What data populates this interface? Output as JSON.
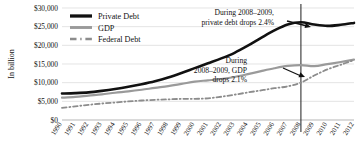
{
  "chart_data": {
    "type": "line",
    "title": "",
    "xlabel": "",
    "ylabel": "In billion",
    "ylim": [
      0,
      30000
    ],
    "y_ticks": [
      "$0",
      "$5,000",
      "$10,000",
      "$15,000",
      "$20,000",
      "$25,000",
      "$30,000"
    ],
    "y_tick_values": [
      0,
      5000,
      10000,
      15000,
      20000,
      25000,
      30000
    ],
    "grid": true,
    "legend_position": "top-left",
    "categories": [
      "1990",
      "1991",
      "1992",
      "1993",
      "1994",
      "1995",
      "1996",
      "1997",
      "1998",
      "1999",
      "2000",
      "2001",
      "2002",
      "2003",
      "2004",
      "2005",
      "2006",
      "2007",
      "2008",
      "2009",
      "2010",
      "2011",
      "2012"
    ],
    "series": [
      {
        "name": "Private Debt",
        "color": "#111111",
        "style": "solid",
        "width": 2.6,
        "values": [
          7100,
          7200,
          7400,
          7800,
          8300,
          8900,
          9600,
          10400,
          11400,
          12600,
          13900,
          15200,
          16500,
          18000,
          19900,
          22000,
          24000,
          25600,
          26200,
          25570,
          25200,
          25500,
          26000
        ]
      },
      {
        "name": "GDP",
        "color": "#9a9a9a",
        "style": "solid",
        "width": 2.2,
        "values": [
          5980,
          6170,
          6540,
          6880,
          7300,
          7660,
          8100,
          8610,
          9090,
          9660,
          10290,
          10620,
          10980,
          11510,
          12270,
          13090,
          13860,
          14480,
          14720,
          14410,
          14960,
          15530,
          16160
        ]
      },
      {
        "name": "Federal Debt",
        "color": "#8c8c8c",
        "style": "dash-dot",
        "width": 1.8,
        "values": [
          3230,
          3660,
          4060,
          4410,
          4690,
          4970,
          5220,
          5410,
          5530,
          5660,
          5670,
          5810,
          6230,
          6780,
          7380,
          7930,
          8510,
          9010,
          10020,
          11900,
          13560,
          14790,
          16070
        ]
      }
    ],
    "annotations": [
      {
        "name": "private-debt-drop",
        "lines": [
          "During 2008–2009,",
          "private debt drops 2.4%"
        ],
        "arrow": "right"
      },
      {
        "name": "gdp-drop",
        "lines": [
          "During",
          "2008–2009, GDP",
          "drops 2.1%"
        ],
        "arrow": "right"
      }
    ],
    "reference_line": {
      "name": "year-2008-marker",
      "x_category": "2008",
      "color": "#333333"
    }
  }
}
